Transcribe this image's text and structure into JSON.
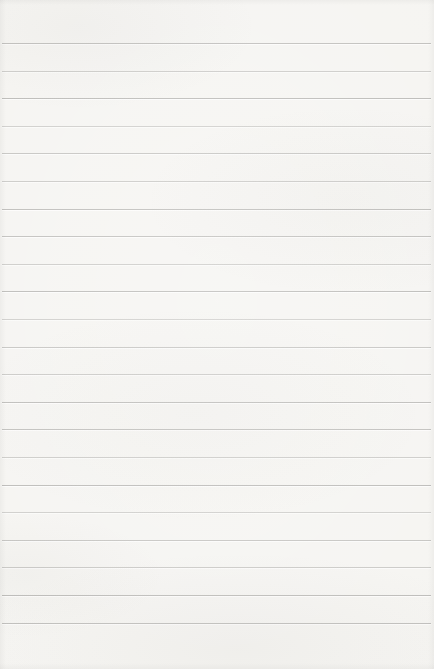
{
  "page": {
    "paper_color": "#f5f4f1",
    "line_color": "#b1b0ad",
    "ruling": {
      "line_count": 22,
      "first_line_top_px": 43,
      "line_spacing_px": 27.6,
      "inset_left_px": 2,
      "inset_right_px": 3,
      "line_thickness_px": 1
    }
  }
}
